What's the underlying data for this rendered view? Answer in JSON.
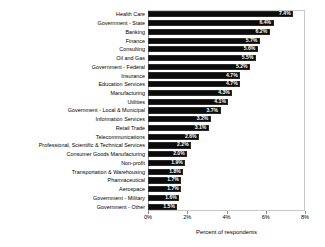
{
  "chart_data": {
    "type": "bar",
    "orientation": "horizontal",
    "title": "",
    "xlabel": "Percent of respondents",
    "ylabel": "",
    "xlim": [
      0,
      8
    ],
    "xticks": [
      "0%",
      "2%",
      "4%",
      "6%",
      "8%"
    ],
    "xtick_values": [
      0,
      2,
      4,
      6,
      8
    ],
    "grid": false,
    "legend": null,
    "bar_color": "#0b0b0b",
    "value_label_color": "#ffffff",
    "categories": [
      "Health Care",
      "Government - State",
      "Banking",
      "Finance",
      "Consulting",
      "Oil and Gas",
      "Government - Federal",
      "Insurance",
      "Education Services",
      "Manufacturing",
      "Utilities",
      "Government - Local & Municipal",
      "Information Services",
      "Retail Trade",
      "Telecommunications",
      "Professional, Scientific & Technical Services",
      "Consumer Goods Manufacturing",
      "Non-profit",
      "Transportation & Warehousing",
      "Pharmaceutical",
      "Aerospace",
      "Government - Military",
      "Government - Other"
    ],
    "values": [
      7.4,
      6.4,
      6.2,
      5.7,
      5.6,
      5.5,
      5.2,
      4.7,
      4.7,
      4.3,
      4.1,
      3.7,
      3.2,
      3.1,
      2.6,
      2.2,
      2.0,
      1.9,
      1.8,
      1.7,
      1.7,
      1.6,
      1.5
    ],
    "value_labels": [
      "7.4%",
      "6.4%",
      "6.2%",
      "5.7%",
      "5.6%",
      "5.5%",
      "5.2%",
      "4.7%",
      "4.7%",
      "4.3%",
      "4.1%",
      "3.7%",
      "3.2%",
      "3.1%",
      "2.6%",
      "2.2%",
      "2.0%",
      "1.9%",
      "1.8%",
      "1.7%",
      "1.7%",
      "1.6%",
      "1.5%"
    ]
  }
}
